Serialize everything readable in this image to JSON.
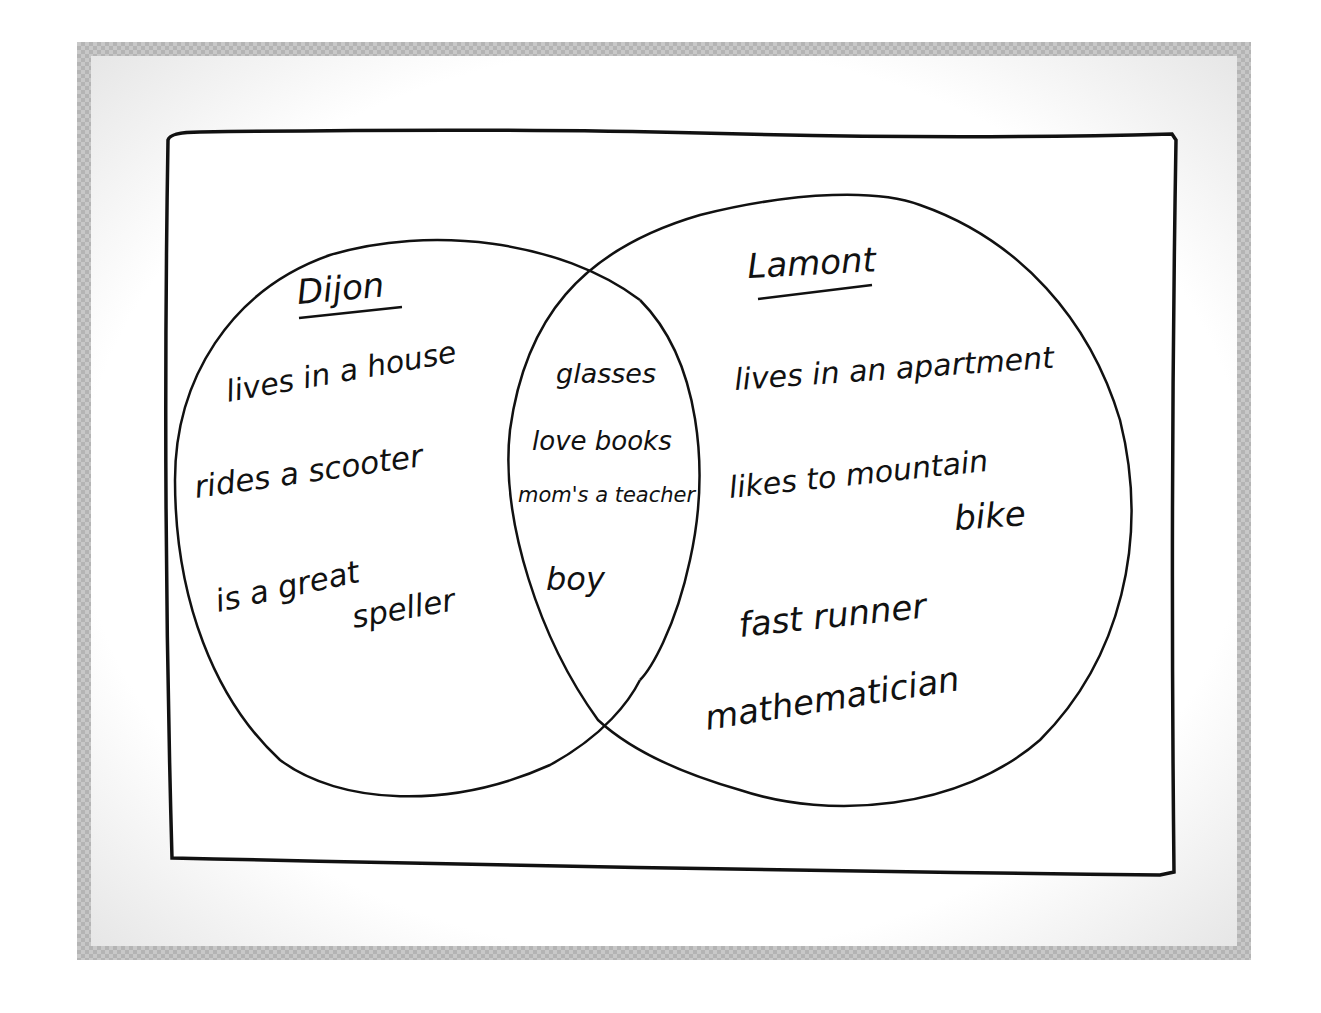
{
  "diagram": {
    "type": "venn",
    "left_set": {
      "title": "Dijon",
      "items": [
        "lives in a house",
        "rides a scooter",
        "is a great",
        "speller"
      ]
    },
    "overlap": {
      "items": [
        "glasses",
        "love books",
        "mom's a teacher",
        "boy"
      ]
    },
    "right_set": {
      "title": "Lamont",
      "items": [
        "lives in an apartment",
        "likes to mountain",
        "bike",
        "fast runner",
        "mathematician"
      ]
    },
    "colors": {
      "ink": "#111111",
      "paper": "#ffffff",
      "frame": "#c8c8c8"
    }
  }
}
